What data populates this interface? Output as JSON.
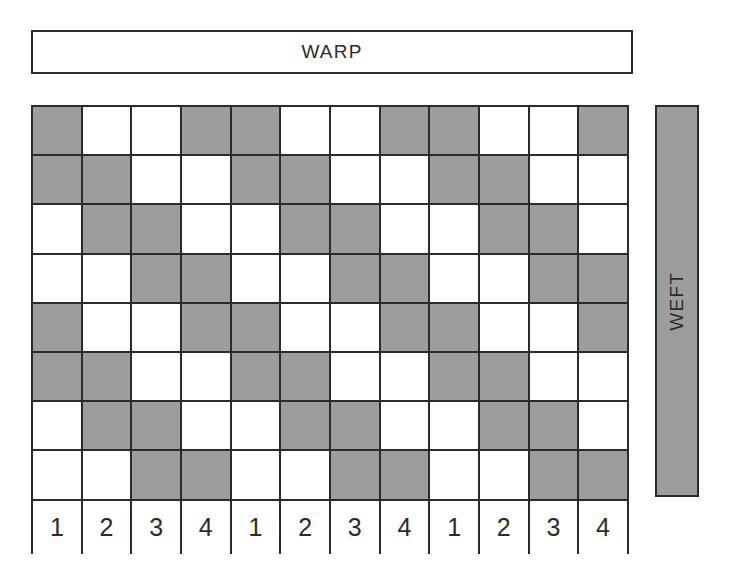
{
  "diagram": {
    "warp": {
      "label": "WARP"
    },
    "weft": {
      "label": "WEFT"
    },
    "colors": {
      "filled": "#9d9d9d",
      "empty": "#ffffff",
      "line": "#2b2b2b",
      "text": "#2b2b2b"
    },
    "grid": {
      "rows": 8,
      "columns": 12,
      "legend": {
        "filled": "warp up",
        "empty": "weft up"
      },
      "pattern": [
        [
          1,
          0,
          0,
          1,
          1,
          0,
          0,
          1,
          1,
          0,
          0,
          1
        ],
        [
          1,
          1,
          0,
          0,
          1,
          1,
          0,
          0,
          1,
          1,
          0,
          0
        ],
        [
          0,
          1,
          1,
          0,
          0,
          1,
          1,
          0,
          0,
          1,
          1,
          0
        ],
        [
          0,
          0,
          1,
          1,
          0,
          0,
          1,
          1,
          0,
          0,
          1,
          1
        ],
        [
          1,
          0,
          0,
          1,
          1,
          0,
          0,
          1,
          1,
          0,
          0,
          1
        ],
        [
          1,
          1,
          0,
          0,
          1,
          1,
          0,
          0,
          1,
          1,
          0,
          0
        ],
        [
          0,
          1,
          1,
          0,
          0,
          1,
          1,
          0,
          0,
          1,
          1,
          0
        ],
        [
          0,
          0,
          1,
          1,
          0,
          0,
          1,
          1,
          0,
          0,
          1,
          1
        ]
      ]
    },
    "column_numbers": [
      "1",
      "2",
      "3",
      "4",
      "1",
      "2",
      "3",
      "4",
      "1",
      "2",
      "3",
      "4"
    ]
  }
}
